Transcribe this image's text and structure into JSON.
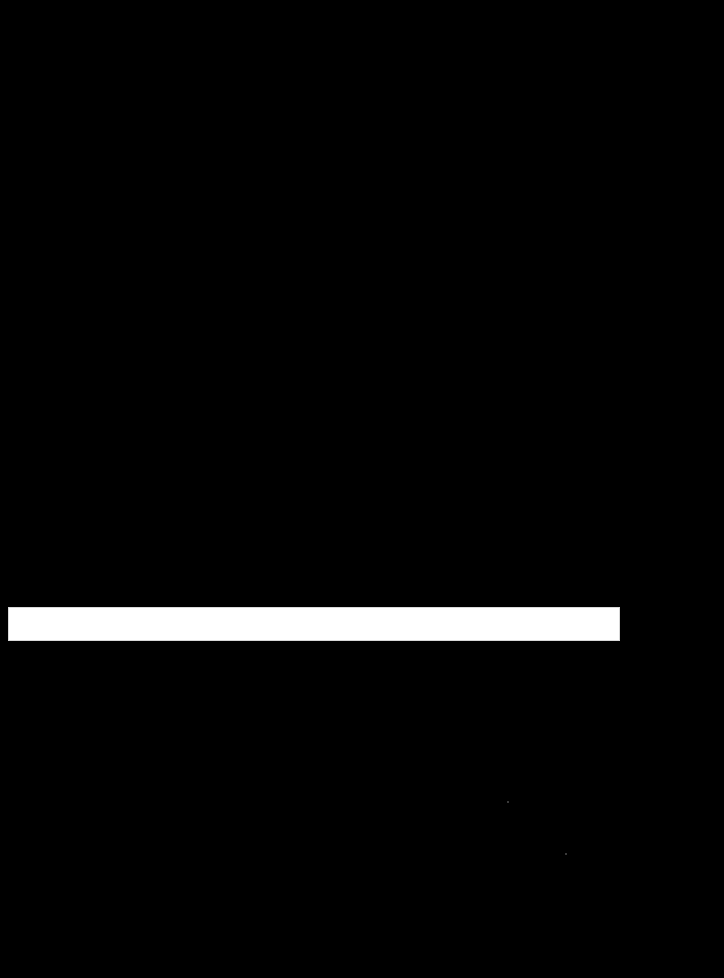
{
  "screen": {
    "background_color": "#000000"
  },
  "bar": {
    "value": "",
    "color": "#ffffff"
  }
}
